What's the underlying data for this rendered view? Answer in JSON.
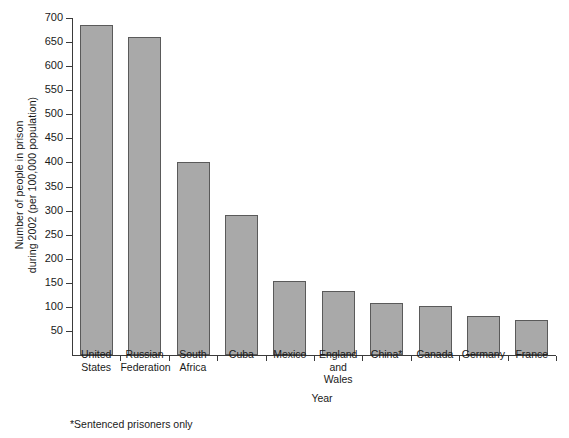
{
  "chart_data": {
    "type": "bar",
    "title": "",
    "xlabel": "Year",
    "ylabel": "Number of people in prison during 2002 (per 100,000 population)",
    "ylabel_lines": [
      "Number of people in prison",
      "during 2002 (per 100,000 population)"
    ],
    "categories": [
      "United States",
      "Russian Federation",
      "South Africa",
      "Cuba",
      "Mexico",
      "England and Wales",
      "China*",
      "Canada",
      "Germany",
      "France"
    ],
    "category_lines": [
      [
        "United",
        "States"
      ],
      [
        "Russian",
        "Federation"
      ],
      [
        "South",
        "Africa"
      ],
      [
        "Cuba"
      ],
      [
        "Mexico"
      ],
      [
        "England",
        "and",
        "Wales"
      ],
      [
        "China*"
      ],
      [
        "Canada"
      ],
      [
        "Germany"
      ],
      [
        "France"
      ]
    ],
    "values": [
      686,
      660,
      400,
      290,
      153,
      133,
      108,
      102,
      81,
      73
    ],
    "ylim": [
      0,
      700
    ],
    "yticks": [
      50,
      100,
      150,
      200,
      250,
      300,
      350,
      400,
      450,
      500,
      550,
      600,
      650,
      700
    ],
    "ytick_labels": [
      "50",
      "100",
      "150",
      "200",
      "250",
      "300",
      "350",
      "400",
      "450",
      "500",
      "550",
      "600",
      "650",
      "700"
    ],
    "grid": false,
    "legend": "none",
    "bar_color": "#a9a9a9",
    "bar_edge_color": "#5a5a5a",
    "axis_color": "#3b3b3b"
  },
  "footnote": "*Sentenced prisoners only"
}
